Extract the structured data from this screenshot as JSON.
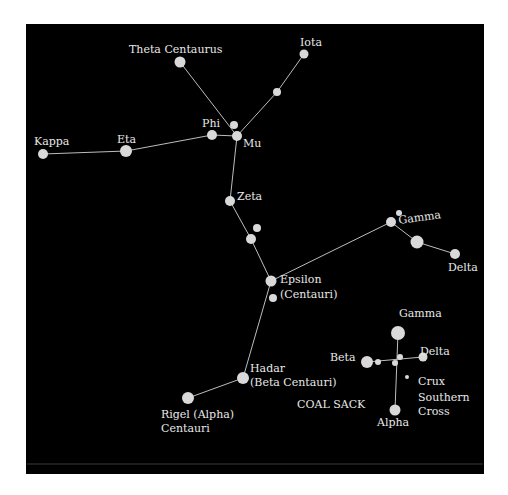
{
  "diagram": {
    "type": "star-chart",
    "background_color": "#000000",
    "star_color": "#d9d9d9",
    "line_color": "#bdbdbd",
    "label_color": "#e8e8e8",
    "panel": {
      "x": 26,
      "y": 24,
      "width": 458,
      "height": 450
    },
    "footer_rule_y": 464
  },
  "stars": [
    {
      "id": "theta-centaurus",
      "x": 180,
      "y": 62,
      "r": 5.5
    },
    {
      "id": "iota",
      "x": 304,
      "y": 54,
      "r": 4.5
    },
    {
      "id": "iota-mu-mid",
      "x": 277,
      "y": 92,
      "r": 4
    },
    {
      "id": "mu-upper-small",
      "x": 234,
      "y": 125,
      "r": 4
    },
    {
      "id": "mu",
      "x": 237,
      "y": 136,
      "r": 5
    },
    {
      "id": "phi",
      "x": 212,
      "y": 135,
      "r": 5
    },
    {
      "id": "eta",
      "x": 126,
      "y": 151,
      "r": 6
    },
    {
      "id": "kappa",
      "x": 43,
      "y": 154,
      "r": 5
    },
    {
      "id": "zeta",
      "x": 230,
      "y": 201,
      "r": 5
    },
    {
      "id": "zeta-small-a",
      "x": 257,
      "y": 228,
      "r": 4
    },
    {
      "id": "zeta-small-b",
      "x": 251,
      "y": 239,
      "r": 5
    },
    {
      "id": "epsilon",
      "x": 271,
      "y": 281,
      "r": 5.5
    },
    {
      "id": "epsilon-small",
      "x": 273,
      "y": 298,
      "r": 4
    },
    {
      "id": "gamma-centauri-small",
      "x": 399,
      "y": 213,
      "r": 3
    },
    {
      "id": "gamma-centauri",
      "x": 391,
      "y": 222,
      "r": 5
    },
    {
      "id": "gamma-delta-mid",
      "x": 417,
      "y": 242,
      "r": 6.5
    },
    {
      "id": "delta-centauri",
      "x": 455,
      "y": 254,
      "r": 5
    },
    {
      "id": "hadar",
      "x": 243,
      "y": 378,
      "r": 6
    },
    {
      "id": "rigel",
      "x": 188,
      "y": 398,
      "r": 6
    },
    {
      "id": "crux-gamma",
      "x": 398,
      "y": 333,
      "r": 7
    },
    {
      "id": "crux-beta",
      "x": 367,
      "y": 362,
      "r": 6
    },
    {
      "id": "crux-beta-small",
      "x": 378,
      "y": 362,
      "r": 3
    },
    {
      "id": "crux-center-a",
      "x": 400,
      "y": 357,
      "r": 3
    },
    {
      "id": "crux-center-b",
      "x": 395,
      "y": 363,
      "r": 3
    },
    {
      "id": "crux-delta",
      "x": 423,
      "y": 357,
      "r": 4.5
    },
    {
      "id": "crux-epsilon",
      "x": 407,
      "y": 377,
      "r": 2
    },
    {
      "id": "crux-alpha",
      "x": 395,
      "y": 410,
      "r": 5.5
    }
  ],
  "lines": [
    {
      "from": "theta-centaurus",
      "to": "mu"
    },
    {
      "from": "iota",
      "to": "iota-mu-mid"
    },
    {
      "from": "iota-mu-mid",
      "to": "mu"
    },
    {
      "from": "kappa",
      "to": "eta"
    },
    {
      "from": "eta",
      "to": "phi"
    },
    {
      "from": "phi",
      "to": "mu"
    },
    {
      "from": "mu",
      "to": "zeta"
    },
    {
      "from": "zeta",
      "to": "zeta-small-b"
    },
    {
      "from": "zeta-small-b",
      "to": "epsilon"
    },
    {
      "from": "epsilon",
      "to": "gamma-centauri"
    },
    {
      "from": "gamma-centauri",
      "to": "gamma-delta-mid"
    },
    {
      "from": "gamma-delta-mid",
      "to": "delta-centauri"
    },
    {
      "from": "epsilon",
      "to": "hadar"
    },
    {
      "from": "hadar",
      "to": "rigel"
    },
    {
      "from": "crux-gamma",
      "to": "crux-alpha"
    },
    {
      "from": "crux-beta",
      "to": "crux-delta"
    }
  ],
  "labels": {
    "theta_centaurus": "Theta Centaurus",
    "iota": "Iota",
    "phi": "Phi",
    "mu": "Mu",
    "kappa": "Kappa",
    "eta": "Eta",
    "zeta": "Zeta",
    "gamma_centauri": "Gamma",
    "delta_centauri": "Delta",
    "epsilon_line1": "Epsilon",
    "epsilon_line2": "(Centauri)",
    "hadar_line1": "Hadar",
    "hadar_line2": "(Beta Centauri)",
    "rigel_line1": "Rigel (Alpha)",
    "rigel_line2": "Centauri",
    "coal_sack": "COAL SACK",
    "crux_gamma": "Gamma",
    "crux_beta": "Beta",
    "crux_delta": "Delta",
    "crux_alpha": "Alpha",
    "crux_line1": "Crux",
    "crux_line2": "Southern",
    "crux_line3": "Cross"
  }
}
